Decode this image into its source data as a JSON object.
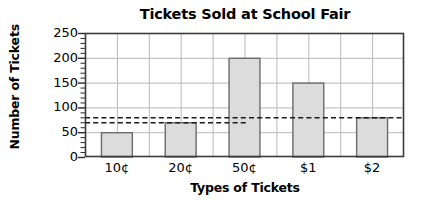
{
  "chart_data": {
    "type": "bar",
    "title": "Tickets Sold at School Fair",
    "xlabel": "Types of Tickets",
    "ylabel": "Number of Tickets",
    "categories": [
      "10¢",
      "20¢",
      "50¢",
      "$1",
      "$2"
    ],
    "values": [
      50,
      70,
      200,
      150,
      80
    ],
    "ylim": [
      0,
      250
    ],
    "yticks": [
      0,
      50,
      100,
      150,
      200,
      250
    ],
    "grid": true,
    "legend": "none",
    "bar_fill": "#dcdcdc",
    "bar_edge": "#6b6b6b",
    "grid_color": "#b8b8b8",
    "axis_color": "#3a3a3a",
    "reference_lines": [
      {
        "name": "mean-line",
        "value": 80,
        "style": "dashed",
        "color": "#1a1a1a",
        "span": "full"
      },
      {
        "name": "median-line",
        "value": 70,
        "style": "dashed",
        "color": "#1a1a1a",
        "span": "left"
      }
    ]
  },
  "ytick_labels": [
    "250",
    "200",
    "150",
    "100",
    "50",
    "0"
  ],
  "xtick_labels": [
    "10¢",
    "20¢",
    "50¢",
    "$1",
    "$2"
  ]
}
